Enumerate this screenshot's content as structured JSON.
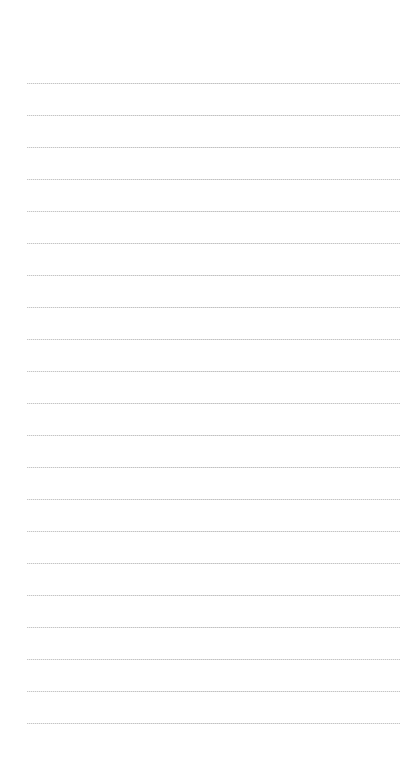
{
  "page": {
    "type": "lined-notepad",
    "line_count": 21,
    "line_color": "#c4c4c4",
    "background_color": "#ffffff",
    "text": []
  }
}
